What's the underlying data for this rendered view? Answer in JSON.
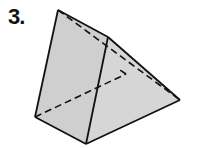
{
  "problem": {
    "number_label": "3."
  },
  "figure": {
    "type": "triangular prism",
    "fill_color": "#cfcfcf",
    "line_color": "#111111",
    "vertices": {
      "A": [
        58,
        10
      ],
      "B": [
        108,
        37
      ],
      "C": [
        180,
        100
      ],
      "D": [
        35,
        117
      ],
      "E": [
        86,
        144
      ],
      "F": [
        126,
        74
      ]
    },
    "solid_edges": [
      [
        "A",
        "D"
      ],
      [
        "A",
        "B"
      ],
      [
        "B",
        "E"
      ],
      [
        "D",
        "E"
      ],
      [
        "E",
        "C"
      ],
      [
        "B",
        "C"
      ]
    ],
    "dashed_edges": [
      [
        "A",
        "C"
      ],
      [
        "D",
        "F"
      ],
      [
        "F",
        "C"
      ],
      [
        "F",
        "B"
      ]
    ]
  }
}
